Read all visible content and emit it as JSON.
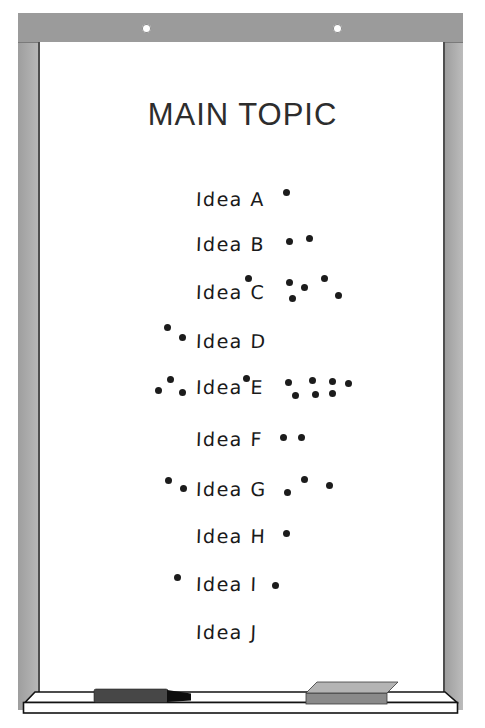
{
  "title": "MAIN TOPIC",
  "board": {
    "frame_color": "#9e9e9e",
    "rail_color": "#9b9b9b",
    "surface_color": "#ffffff",
    "edge_line_color": "#4f4f4f",
    "title_color": "#2d2d2d",
    "ink_color": "#1a1a1a",
    "dot_color": "#1c1c1c"
  },
  "ideas": [
    {
      "label": "Idea A",
      "votes": 1,
      "label_pos": [
        196,
        188
      ],
      "dots": [
        [
          286,
          192
        ]
      ]
    },
    {
      "label": "Idea B",
      "votes": 2,
      "label_pos": [
        196,
        233
      ],
      "dots": [
        [
          289,
          241
        ],
        [
          309,
          238
        ]
      ]
    },
    {
      "label": "Idea C",
      "votes": 6,
      "label_pos": [
        196,
        281
      ],
      "dots": [
        [
          248,
          278
        ],
        [
          289,
          282
        ],
        [
          304,
          287
        ],
        [
          292,
          298
        ],
        [
          324,
          278
        ],
        [
          338,
          295
        ]
      ]
    },
    {
      "label": "Idea D",
      "votes": 2,
      "label_pos": [
        196,
        330
      ],
      "dots": [
        [
          167,
          327
        ],
        [
          182,
          337
        ]
      ]
    },
    {
      "label": "Idea E",
      "votes": 11,
      "label_pos": [
        196,
        376
      ],
      "dots": [
        [
          158,
          390
        ],
        [
          170,
          379
        ],
        [
          182,
          392
        ],
        [
          246,
          378
        ],
        [
          288,
          382
        ],
        [
          312,
          380
        ],
        [
          332,
          381
        ],
        [
          348,
          383
        ],
        [
          295,
          395
        ],
        [
          315,
          394
        ],
        [
          332,
          393
        ]
      ]
    },
    {
      "label": "Idea F",
      "votes": 2,
      "label_pos": [
        196,
        428
      ],
      "dots": [
        [
          283,
          437
        ],
        [
          301,
          437
        ]
      ]
    },
    {
      "label": "Idea G",
      "votes": 5,
      "label_pos": [
        196,
        478
      ],
      "dots": [
        [
          168,
          480
        ],
        [
          183,
          488
        ],
        [
          287,
          492
        ],
        [
          304,
          479
        ],
        [
          329,
          485
        ]
      ]
    },
    {
      "label": "Idea H",
      "votes": 1,
      "label_pos": [
        196,
        525
      ],
      "dots": [
        [
          286,
          533
        ]
      ]
    },
    {
      "label": "Idea I",
      "votes": 2,
      "label_pos": [
        196,
        573
      ],
      "dots": [
        [
          177,
          577
        ],
        [
          275,
          585
        ]
      ]
    },
    {
      "label": "Idea J",
      "votes": 0,
      "label_pos": [
        196,
        621
      ],
      "dots": []
    }
  ],
  "tray": {
    "name": "marker-tray",
    "marker": {
      "name": "dry-erase-marker",
      "body_color": "#474747",
      "tip_color": "#0e0e0e"
    },
    "eraser": {
      "name": "whiteboard-eraser",
      "top_color": "#b4b4b4",
      "front_color": "#8a8a8a"
    }
  }
}
